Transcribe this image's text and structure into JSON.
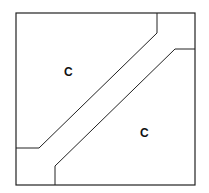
{
  "diagram": {
    "labels": [
      {
        "text": "C",
        "x": 68,
        "y": 76
      },
      {
        "text": "C",
        "x": 144,
        "y": 137
      }
    ],
    "stroke_color": "#222222",
    "background": "#ffffff"
  }
}
